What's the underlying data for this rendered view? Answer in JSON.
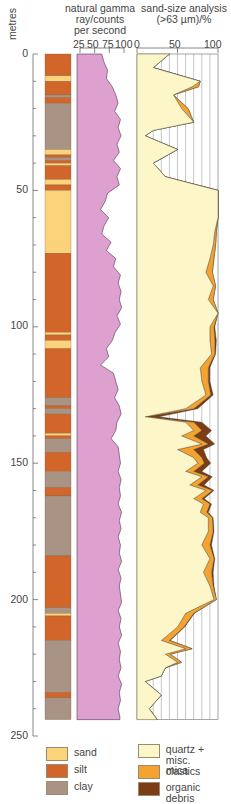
{
  "chart_data": [
    {
      "type": "table",
      "title": "Lithology log",
      "ylabel": "metres",
      "ylim": [
        0,
        250
      ],
      "yticks": [
        0,
        50,
        100,
        150,
        200,
        250
      ],
      "layers": [
        {
          "top": 0,
          "base": 8,
          "lith": "silt"
        },
        {
          "top": 8,
          "base": 10,
          "lith": "sand"
        },
        {
          "top": 10,
          "base": 15,
          "lith": "silt"
        },
        {
          "top": 15,
          "base": 16,
          "lith": "clay"
        },
        {
          "top": 16,
          "base": 18,
          "lith": "silt"
        },
        {
          "top": 18,
          "base": 35,
          "lith": "clay"
        },
        {
          "top": 35,
          "base": 37,
          "lith": "sand"
        },
        {
          "top": 37,
          "base": 38,
          "lith": "silt"
        },
        {
          "top": 38,
          "base": 39,
          "lith": "clay"
        },
        {
          "top": 39,
          "base": 40,
          "lith": "silt"
        },
        {
          "top": 40,
          "base": 41,
          "lith": "sand"
        },
        {
          "top": 41,
          "base": 46,
          "lith": "silt"
        },
        {
          "top": 46,
          "base": 48,
          "lith": "sand"
        },
        {
          "top": 48,
          "base": 50,
          "lith": "silt"
        },
        {
          "top": 50,
          "base": 73,
          "lith": "sand"
        },
        {
          "top": 73,
          "base": 102,
          "lith": "silt"
        },
        {
          "top": 102,
          "base": 103,
          "lith": "sand"
        },
        {
          "top": 103,
          "base": 105,
          "lith": "silt"
        },
        {
          "top": 105,
          "base": 108,
          "lith": "sand"
        },
        {
          "top": 108,
          "base": 126,
          "lith": "silt"
        },
        {
          "top": 126,
          "base": 129,
          "lith": "clay"
        },
        {
          "top": 129,
          "base": 130,
          "lith": "silt"
        },
        {
          "top": 130,
          "base": 132,
          "lith": "clay"
        },
        {
          "top": 132,
          "base": 139,
          "lith": "silt"
        },
        {
          "top": 139,
          "base": 140,
          "lith": "sand"
        },
        {
          "top": 140,
          "base": 141,
          "lith": "silt"
        },
        {
          "top": 141,
          "base": 146,
          "lith": "clay"
        },
        {
          "top": 146,
          "base": 153,
          "lith": "silt"
        },
        {
          "top": 153,
          "base": 159,
          "lith": "clay"
        },
        {
          "top": 159,
          "base": 162,
          "lith": "silt"
        },
        {
          "top": 162,
          "base": 184,
          "lith": "clay"
        },
        {
          "top": 184,
          "base": 203,
          "lith": "silt"
        },
        {
          "top": 203,
          "base": 205,
          "lith": "clay"
        },
        {
          "top": 205,
          "base": 206,
          "lith": "sand"
        },
        {
          "top": 206,
          "base": 215,
          "lith": "silt"
        },
        {
          "top": 215,
          "base": 234,
          "lith": "clay"
        },
        {
          "top": 234,
          "base": 236,
          "lith": "silt"
        },
        {
          "top": 236,
          "base": 244,
          "lith": "clay"
        }
      ]
    },
    {
      "type": "area",
      "title": "natural gamma ray/counts per second",
      "xlim": [
        25,
        100
      ],
      "xticks": [
        25,
        50,
        75,
        100
      ],
      "ylim": [
        0,
        250
      ],
      "depth": [
        0,
        3,
        6,
        9,
        12,
        15,
        18,
        21,
        24,
        27,
        30,
        33,
        36,
        39,
        42,
        45,
        48,
        51,
        54,
        57,
        60,
        63,
        66,
        69,
        72,
        75,
        78,
        81,
        84,
        87,
        90,
        93,
        96,
        99,
        102,
        105,
        108,
        111,
        114,
        117,
        120,
        123,
        126,
        129,
        132,
        135,
        138,
        141,
        144,
        147,
        150,
        153,
        156,
        159,
        162,
        165,
        168,
        171,
        174,
        177,
        180,
        183,
        186,
        189,
        192,
        195,
        198,
        201,
        204,
        207,
        210,
        213,
        216,
        219,
        222,
        225,
        228,
        231,
        234,
        237,
        240,
        243
      ],
      "counts": [
        62,
        66,
        72,
        70,
        80,
        86,
        90,
        84,
        94,
        90,
        95,
        88,
        92,
        82,
        94,
        88,
        92,
        72,
        68,
        60,
        74,
        66,
        62,
        78,
        70,
        86,
        82,
        94,
        90,
        95,
        92,
        96,
        88,
        94,
        85,
        80,
        70,
        74,
        60,
        82,
        86,
        90,
        84,
        92,
        95,
        88,
        86,
        78,
        90,
        92,
        94,
        90,
        95,
        92,
        94,
        90,
        96,
        92,
        95,
        90,
        94,
        92,
        96,
        90,
        95,
        92,
        94,
        96,
        90,
        95,
        92,
        96,
        90,
        94,
        92,
        95,
        90,
        96,
        92,
        94,
        90,
        93
      ]
    },
    {
      "type": "area",
      "title": "sand-size analysis (>63 µm)/%",
      "xlim": [
        0,
        100
      ],
      "xticks": [
        0,
        50,
        100
      ],
      "ylim": [
        0,
        250
      ],
      "series_note": "cumulative stacked: quartz + misc. clastics, mica, organic debris",
      "depth": [
        0,
        5,
        10,
        12,
        15,
        20,
        25,
        28,
        30,
        35,
        40,
        45,
        50,
        55,
        60,
        65,
        70,
        75,
        80,
        85,
        90,
        95,
        100,
        105,
        110,
        115,
        120,
        125,
        130,
        133,
        135,
        138,
        140,
        143,
        145,
        148,
        150,
        153,
        155,
        158,
        160,
        163,
        165,
        168,
        170,
        175,
        180,
        185,
        190,
        195,
        200,
        205,
        210,
        215,
        218,
        220,
        223,
        225,
        228,
        230,
        235,
        240,
        244
      ],
      "quartz": [
        40,
        20,
        78,
        68,
        45,
        55,
        70,
        20,
        10,
        50,
        20,
        35,
        100,
        100,
        100,
        96,
        94,
        90,
        85,
        94,
        88,
        100,
        90,
        90,
        92,
        78,
        80,
        85,
        60,
        10,
        60,
        70,
        55,
        80,
        50,
        70,
        75,
        60,
        80,
        65,
        85,
        70,
        82,
        78,
        88,
        88,
        80,
        90,
        82,
        90,
        95,
        60,
        50,
        30,
        60,
        35,
        50,
        35,
        30,
        10,
        30,
        15,
        25
      ],
      "mica": [
        0,
        0,
        0,
        8,
        0,
        8,
        0,
        0,
        0,
        0,
        0,
        0,
        0,
        0,
        0,
        2,
        3,
        5,
        8,
        3,
        6,
        0,
        5,
        6,
        4,
        10,
        8,
        6,
        10,
        2,
        10,
        10,
        15,
        8,
        20,
        10,
        8,
        10,
        8,
        10,
        8,
        10,
        8,
        8,
        5,
        6,
        10,
        5,
        10,
        4,
        3,
        10,
        8,
        10,
        8,
        6,
        5,
        0,
        0,
        0,
        0,
        0,
        0
      ],
      "organic_debris": [
        0,
        0,
        0,
        0,
        0,
        0,
        0,
        0,
        0,
        0,
        0,
        0,
        0,
        0,
        0,
        0,
        0,
        0,
        0,
        0,
        0,
        0,
        1,
        2,
        1,
        2,
        2,
        3,
        5,
        15,
        10,
        12,
        15,
        8,
        12,
        6,
        8,
        10,
        5,
        8,
        2,
        3,
        2,
        2,
        1,
        1,
        2,
        1,
        2,
        1,
        0,
        1,
        1,
        1,
        0,
        0,
        0,
        0,
        0,
        0,
        0,
        0,
        0
      ]
    }
  ],
  "axis": {
    "depth_label": "metres",
    "depth_ticks": [
      "0",
      "50",
      "100",
      "150",
      "200",
      "250"
    ]
  },
  "headers": {
    "gamma_line1": "natural gamma",
    "gamma_line2": "ray/counts",
    "gamma_line3": "per second",
    "gamma_ticks": [
      "25",
      "50",
      "75",
      "100"
    ],
    "sand_line1": "sand-size analysis",
    "sand_line2": "(>63 µm)/%",
    "sand_ticks": [
      "0",
      "50",
      "100"
    ]
  },
  "legend": {
    "lithology": [
      {
        "label": "sand",
        "color": "#fbd37a"
      },
      {
        "label": "silt",
        "color": "#d2662a"
      },
      {
        "label": "clay",
        "color": "#a89384"
      }
    ],
    "components": [
      {
        "label": "quartz + misc. clastics",
        "label_line1": "quartz + misc.",
        "label_line2": "clastics",
        "color": "#fdf6c8"
      },
      {
        "label": "mica",
        "color": "#f4a330"
      },
      {
        "label": "organic debris",
        "color": "#7a3d16"
      }
    ]
  },
  "colors": {
    "gamma_fill": "#dea0cf",
    "axis": "#6a6a6a",
    "grid": "#8a8a8a"
  }
}
